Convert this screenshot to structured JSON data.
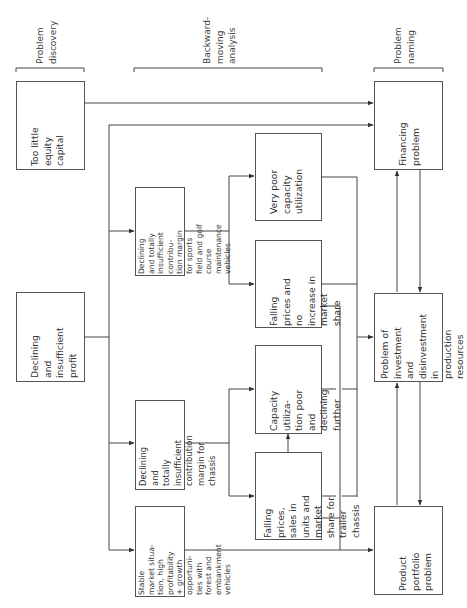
{
  "headers": {
    "discovery": "Problem\ndiscovery",
    "analysis": "Backward-\nmoving\nanalysis",
    "naming": "Problem\nnaming"
  },
  "discovery": {
    "equity": "Too little equity\ncapital",
    "profit": "Declining and\ninsufficient\nprofit"
  },
  "segments": {
    "sports": "Declining and totally\ninsufficient contribu-\ntion margin for sports\nfield and golf course\nmaintenance vehicles",
    "chassis": "Declining and\ntotally insufficient\ncontribution\nmargin for chassis",
    "stable": "Stable market situa-\ntion, high profitability\n+ growth opportuni-\nties with forest and\nembankment vehicles"
  },
  "causes": {
    "very_poor": "Very poor\ncapacity\nutilization",
    "falling_no_increase": "Falling prices and\nno increase in\nmarket share",
    "capacity_declining": "Capacity utiliza-\ntion poor and\ndeclining further",
    "falling_trailer": "Falling prices,\nsales in units and\nmarket share for\ntrailer chassis"
  },
  "problems": {
    "financing": "Financing\nproblem",
    "investment": "Problem of\ninvestment and\ndisinvestment in\nproduction\nresources",
    "portfolio": "Product portfolio\nproblem"
  },
  "colors": {
    "line": "#444444",
    "box_border": "#555555",
    "text": "#333333"
  }
}
